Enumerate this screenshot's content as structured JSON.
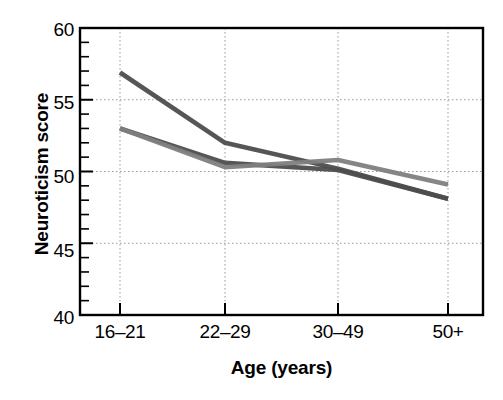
{
  "chart_data": {
    "type": "line",
    "title": "",
    "xlabel": "Age (years)",
    "ylabel": "Neuroticism score",
    "categories": [
      "16–21",
      "22–29",
      "30–49",
      "50+"
    ],
    "ylim": [
      40,
      60
    ],
    "y_ticks": [
      40,
      45,
      50,
      55,
      60
    ],
    "y_tick_labels": [
      "40",
      "45",
      "50",
      "55",
      "60"
    ],
    "y_minor_tick_step": 1,
    "grid": "dotted gridlines at major y ticks and at each x category",
    "legend": "none",
    "series": [
      {
        "name": "series-1",
        "color": "#4d4d4d",
        "values": [
          56.9,
          52.0,
          50.2,
          48.1
        ]
      },
      {
        "name": "series-2",
        "color": "#4d4d4d",
        "values": [
          53.0,
          50.6,
          50.1,
          48.1
        ]
      },
      {
        "name": "series-3",
        "color": "#808080",
        "values": [
          53.0,
          50.3,
          50.8,
          49.1
        ]
      }
    ]
  },
  "axes": {
    "y_title": "Neuroticism score",
    "x_title": "Age (years)",
    "y_labels": [
      "60",
      "55",
      "50",
      "45",
      "40"
    ],
    "x_labels": [
      "16–21",
      "22–29",
      "30–49",
      "50+"
    ]
  },
  "colors": {
    "frame": "#000000",
    "grid": "#999999",
    "series_dark": "#4d4d4d",
    "series_mid": "#808080",
    "background": "#ffffff"
  }
}
